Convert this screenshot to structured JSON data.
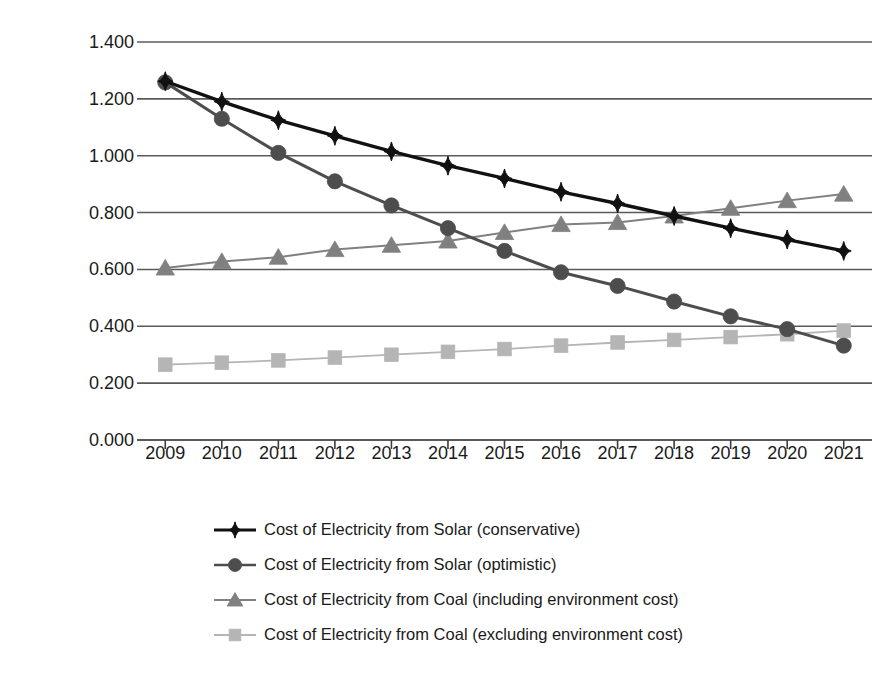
{
  "chart_data": {
    "type": "line",
    "title": "",
    "xlabel": "",
    "ylabel": "Cost per KWH / Yuan-kwh",
    "ylabel_sup": "-1",
    "grid": true,
    "legend_position": "bottom",
    "categories": [
      "2009",
      "2010",
      "2011",
      "2012",
      "2013",
      "2014",
      "2015",
      "2016",
      "2017",
      "2018",
      "2019",
      "2020",
      "2021"
    ],
    "x": [
      2009,
      2010,
      2011,
      2012,
      2013,
      2014,
      2015,
      2016,
      2017,
      2018,
      2019,
      2020,
      2021
    ],
    "ylim": [
      0.0,
      1.4
    ],
    "yticks": [
      "0.000",
      "0.200",
      "0.400",
      "0.600",
      "0.800",
      "1.000",
      "1.200",
      "1.400"
    ],
    "ytick_values": [
      0.0,
      0.2,
      0.4,
      0.6,
      0.8,
      1.0,
      1.2,
      1.4
    ],
    "series": [
      {
        "name": "Cost of Electricity from Solar (conservative)",
        "marker": "diamond",
        "color": "#111111",
        "values": [
          1.262,
          1.19,
          1.125,
          1.07,
          1.015,
          0.965,
          0.92,
          0.873,
          0.832,
          0.788,
          0.745,
          0.705,
          0.665
        ]
      },
      {
        "name": "Cost of Electricity from Solar (optimistic)",
        "marker": "circle",
        "color": "#4d4d4d",
        "values": [
          1.258,
          1.13,
          1.01,
          0.91,
          0.825,
          0.745,
          0.665,
          0.59,
          0.542,
          0.487,
          0.435,
          0.39,
          0.332
        ]
      },
      {
        "name": "Cost of Electricity from Coal (including environment cost)",
        "marker": "triangle",
        "color": "#808080",
        "values": [
          0.605,
          0.628,
          0.643,
          0.67,
          0.685,
          0.7,
          0.73,
          0.758,
          0.765,
          0.788,
          0.815,
          0.842,
          0.865
        ]
      },
      {
        "name": "Cost of Electricity from Coal (excluding environment cost)",
        "marker": "square",
        "color": "#b5b5b5",
        "values": [
          0.265,
          0.272,
          0.28,
          0.29,
          0.3,
          0.31,
          0.32,
          0.332,
          0.343,
          0.352,
          0.362,
          0.372,
          0.385
        ]
      }
    ]
  },
  "legend": {
    "items": [
      {
        "label": "Cost of Electricity from Solar (conservative)",
        "marker": "diamond",
        "color": "#111111"
      },
      {
        "label": "Cost of Electricity from Solar (optimistic)",
        "marker": "circle",
        "color": "#4d4d4d"
      },
      {
        "label": "Cost of Electricity from Coal (including environment cost)",
        "marker": "triangle",
        "color": "#808080"
      },
      {
        "label": "Cost of Electricity from Coal (excluding environment cost)",
        "marker": "square",
        "color": "#b5b5b5"
      }
    ]
  },
  "axis": {
    "y_title_text": "Cost per KWH / Yuan-kwh",
    "y_title_sup": "-1"
  },
  "colors": {
    "gridline": "#5a5a5a",
    "axis": "#3d3d3d",
    "text": "#1a1a1a",
    "background": "#ffffff"
  }
}
